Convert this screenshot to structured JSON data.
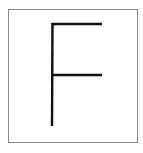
{
  "image": {
    "letter": "F",
    "frame_color": "#8a8a8a",
    "stroke_color": "#111111",
    "background": "#ffffff"
  }
}
